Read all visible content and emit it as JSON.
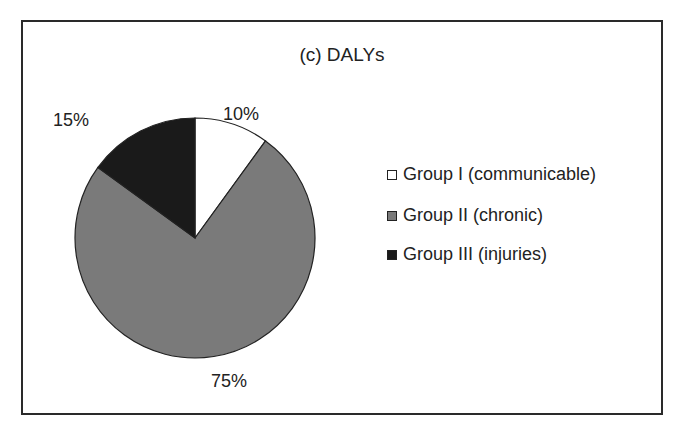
{
  "chart_data": {
    "type": "pie",
    "title": "(c) DALYs",
    "categories": [
      "Group I (communicable)",
      "Group II (chronic)",
      "Group III (injuries)"
    ],
    "values": [
      10,
      75,
      15
    ],
    "labels": [
      "10%",
      "75%",
      "15%"
    ],
    "colors": [
      "#ffffff",
      "#7a7a7a",
      "#1a1a1a"
    ],
    "start_angle": "12 o'clock, clockwise",
    "legend_position": "right"
  },
  "title": "(c) DALYs",
  "slices": [
    {
      "label": "10%",
      "name": "Group I (communicable)",
      "color": "#ffffff"
    },
    {
      "label": "75%",
      "name": "Group II (chronic)",
      "color": "#7a7a7a"
    },
    {
      "label": "15%",
      "name": "Group III (injuries)",
      "color": "#1a1a1a"
    }
  ],
  "legend": [
    {
      "label": "Group I (communicable)",
      "color": "#ffffff"
    },
    {
      "label": "Group II (chronic)",
      "color": "#7a7a7a"
    },
    {
      "label": "Group III (injuries)",
      "color": "#1a1a1a"
    }
  ]
}
